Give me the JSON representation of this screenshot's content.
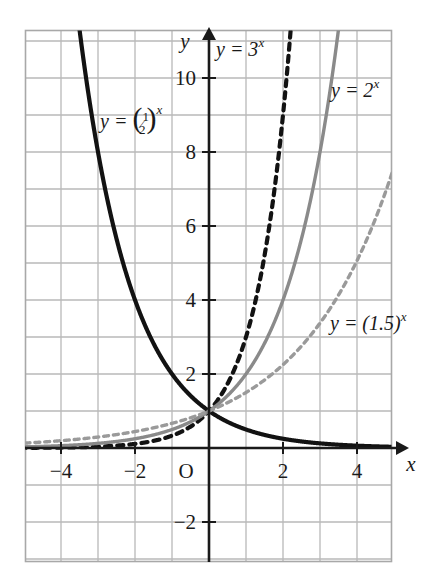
{
  "chart_data": {
    "type": "line",
    "title": "",
    "xlabel": "x",
    "ylabel": "y",
    "xlim": [
      -5,
      5
    ],
    "ylim": [
      -3,
      11
    ],
    "grid": true,
    "grid_step": 1,
    "legend_position": "inline-annotations",
    "x_ticks": [
      "-4",
      "-2",
      "2",
      "4"
    ],
    "x_tick_values": [
      -4,
      -2,
      2,
      4
    ],
    "y_ticks": [
      "10",
      "8",
      "6",
      "4",
      "2",
      "-2"
    ],
    "y_tick_values": [
      10,
      8,
      6,
      4,
      2,
      -2
    ],
    "origin_label": "O",
    "series": [
      {
        "name": "y = (1/2)^x",
        "label": "y = (½)ˣ",
        "base": 0.5,
        "style": "solid",
        "color": "#121212",
        "width": 4.2,
        "label_x": 100,
        "label_y": 128,
        "x": [
          -5,
          -4,
          -3,
          -2,
          -1,
          0,
          1,
          2,
          3,
          4,
          5
        ],
        "values": [
          0.031,
          0.063,
          0.125,
          0.25,
          0.5,
          1,
          2,
          4,
          8,
          16,
          32
        ]
      },
      {
        "name": "y = 3^x",
        "label": "y = 3ˣ",
        "base": 3,
        "style": "dashed",
        "color": "#121212",
        "width": 4.2,
        "label_x": 216,
        "label_y": 56,
        "x": [
          -5,
          -4,
          -3,
          -2,
          -1,
          0,
          1,
          2,
          3,
          4,
          5
        ],
        "values": [
          0.004,
          0.012,
          0.037,
          0.111,
          0.333,
          1,
          3,
          9,
          27,
          81,
          243
        ]
      },
      {
        "name": "y = 2^x",
        "label": "y = 2ˣ",
        "base": 2,
        "style": "solid",
        "color": "#8a8a8a",
        "width": 3.4,
        "label_x": 331,
        "label_y": 97,
        "x": [
          -5,
          -4,
          -3,
          -2,
          -1,
          0,
          1,
          2,
          3,
          4,
          5
        ],
        "values": [
          0.031,
          0.063,
          0.125,
          0.25,
          0.5,
          1,
          2,
          4,
          8,
          16,
          32
        ]
      },
      {
        "name": "y = (1.5)^x",
        "label": "y = (1.5)ˣ",
        "base": 1.5,
        "style": "dashed",
        "color": "#9a9a9a",
        "width": 3.4,
        "label_x": 330,
        "label_y": 330,
        "x": [
          -5,
          -4,
          -3,
          -2,
          -1,
          0,
          1,
          2,
          3,
          4,
          5
        ],
        "values": [
          0.132,
          0.198,
          0.296,
          0.444,
          0.667,
          1,
          1.5,
          2.25,
          3.375,
          5.063,
          7.594
        ]
      }
    ],
    "colors": {
      "grid": "#b8b8b8",
      "axis": "#1a1a1a",
      "border": "#a8a8a8",
      "text": "#1a1a1a"
    }
  }
}
